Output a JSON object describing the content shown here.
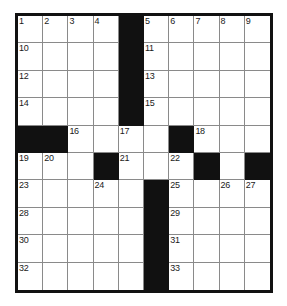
{
  "puzzle": {
    "type": "crossword-grid",
    "columns": 10,
    "rows": 10,
    "colors": {
      "block": "#111111",
      "cell": "#ffffff",
      "inner_rule": "#8a8a8a",
      "outer_border": "#111111",
      "number_text": "#1a1a1a"
    },
    "legend": {
      "block_symbol": "#",
      "open_symbol": "."
    },
    "layout": [
      "....#.....",
      "....#.....",
      "....#.....",
      "....#.....",
      "##....#...",
      "...#...#.#",
      ".....#....",
      ".....#....",
      ".....#....",
      ".....#...."
    ],
    "numbers": [
      {
        "row": 0,
        "col": 0,
        "label": "1"
      },
      {
        "row": 0,
        "col": 1,
        "label": "2"
      },
      {
        "row": 0,
        "col": 2,
        "label": "3"
      },
      {
        "row": 0,
        "col": 3,
        "label": "4"
      },
      {
        "row": 0,
        "col": 5,
        "label": "5"
      },
      {
        "row": 0,
        "col": 6,
        "label": "6"
      },
      {
        "row": 0,
        "col": 7,
        "label": "7"
      },
      {
        "row": 0,
        "col": 8,
        "label": "8"
      },
      {
        "row": 0,
        "col": 9,
        "label": "9"
      },
      {
        "row": 1,
        "col": 0,
        "label": "10"
      },
      {
        "row": 1,
        "col": 5,
        "label": "11"
      },
      {
        "row": 2,
        "col": 0,
        "label": "12"
      },
      {
        "row": 2,
        "col": 5,
        "label": "13"
      },
      {
        "row": 3,
        "col": 0,
        "label": "14"
      },
      {
        "row": 3,
        "col": 5,
        "label": "15"
      },
      {
        "row": 4,
        "col": 2,
        "label": "16"
      },
      {
        "row": 4,
        "col": 4,
        "label": "17"
      },
      {
        "row": 4,
        "col": 7,
        "label": "18"
      },
      {
        "row": 5,
        "col": 0,
        "label": "19"
      },
      {
        "row": 5,
        "col": 1,
        "label": "20"
      },
      {
        "row": 5,
        "col": 4,
        "label": "21"
      },
      {
        "row": 5,
        "col": 6,
        "label": "22"
      },
      {
        "row": 6,
        "col": 0,
        "label": "23"
      },
      {
        "row": 6,
        "col": 3,
        "label": "24"
      },
      {
        "row": 6,
        "col": 6,
        "label": "25"
      },
      {
        "row": 6,
        "col": 8,
        "label": "26"
      },
      {
        "row": 6,
        "col": 9,
        "label": "27"
      },
      {
        "row": 7,
        "col": 0,
        "label": "28"
      },
      {
        "row": 7,
        "col": 6,
        "label": "29"
      },
      {
        "row": 8,
        "col": 0,
        "label": "30"
      },
      {
        "row": 8,
        "col": 6,
        "label": "31"
      },
      {
        "row": 9,
        "col": 0,
        "label": "32"
      },
      {
        "row": 9,
        "col": 6,
        "label": "33"
      }
    ],
    "entries": []
  }
}
